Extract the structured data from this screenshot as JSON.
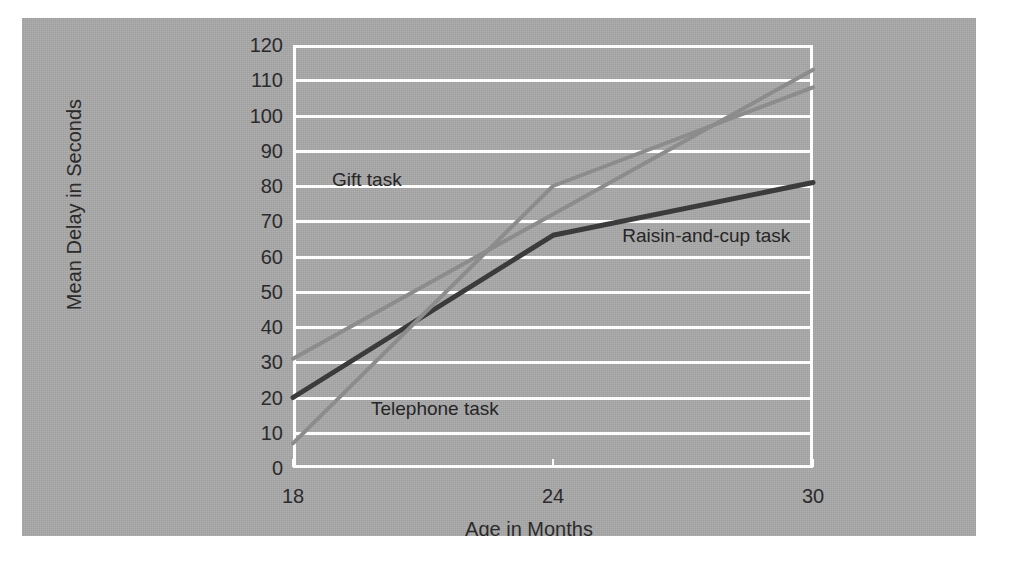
{
  "figure": {
    "background_color": "#a9a9a9",
    "page_color": "#ffffff",
    "grid_color": "#fdfdfd",
    "text_color": "#2b2b2b"
  },
  "chart_data": {
    "type": "line",
    "title": "",
    "xlabel": "Age in Months",
    "ylabel": "Mean Delay in Seconds",
    "x": [
      18,
      24,
      30
    ],
    "xtick_labels": [
      "18",
      "24",
      "30"
    ],
    "xlim": [
      18,
      30
    ],
    "ylim": [
      0,
      120
    ],
    "ytick_labels": [
      "0",
      "10",
      "20",
      "30",
      "40",
      "50",
      "60",
      "70",
      "80",
      "90",
      "100",
      "110",
      "120"
    ],
    "yticks": [
      0,
      10,
      20,
      30,
      40,
      50,
      60,
      70,
      80,
      90,
      100,
      110,
      120
    ],
    "grid": true,
    "legend_position": "inline-annotations",
    "series": [
      {
        "name": "Gift task",
        "values": [
          31,
          72,
          113
        ],
        "color": "#8c8c8c",
        "line_width": 4,
        "label_x": 18.9,
        "label_y": 82
      },
      {
        "name": "Raisin-and-cup task",
        "values": [
          20,
          66,
          81
        ],
        "color": "#3b3b3b",
        "line_width": 5,
        "label_x": 25.6,
        "label_y": 66
      },
      {
        "name": "Telephone task",
        "values": [
          7,
          80,
          108
        ],
        "color": "#8c8c8c",
        "line_width": 4,
        "label_x": 19.8,
        "label_y": 17
      }
    ]
  }
}
